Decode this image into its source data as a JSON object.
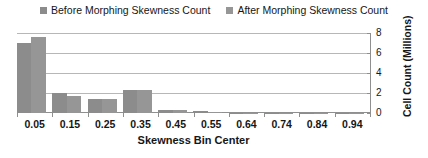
{
  "legend": {
    "position": "top-center",
    "entries": [
      {
        "label": "Before Morphing Skewness Count",
        "color": "#8c8c8c",
        "icon": "square-marker-icon"
      },
      {
        "label": "After Morphing Skewness Count",
        "color": "#969696",
        "icon": "square-marker-icon"
      }
    ]
  },
  "axes": {
    "x_title": "Skewness Bin Center",
    "y_title": "Cell Count (Millions)",
    "y_ticks": [
      "0",
      "2",
      "4",
      "6",
      "8"
    ]
  },
  "chart_data": {
    "type": "bar",
    "title": "",
    "subtitle": "",
    "xlabel": "Skewness Bin Center",
    "ylabel": "Cell Count (Millions)",
    "categories": [
      "0.05",
      "0.15",
      "0.25",
      "0.35",
      "0.45",
      "0.55",
      "0.64",
      "0.74",
      "0.84",
      "0.94"
    ],
    "series": [
      {
        "name": "Before Morphing Skewness Count",
        "color": "#8c8c8c",
        "values": [
          7.0,
          2.0,
          1.4,
          2.3,
          0.35,
          0.2,
          0.05,
          0.02,
          0.01,
          0.01
        ]
      },
      {
        "name": "After Morphing Skewness Count",
        "color": "#969696",
        "values": [
          7.6,
          1.7,
          1.4,
          2.3,
          0.3,
          0.15,
          0.04,
          0.02,
          0.01,
          0.01
        ]
      }
    ],
    "ylim": [
      0,
      8
    ],
    "y_tick_values": [
      0,
      2,
      4,
      6,
      8
    ],
    "grid": true,
    "legend_position": "top"
  }
}
